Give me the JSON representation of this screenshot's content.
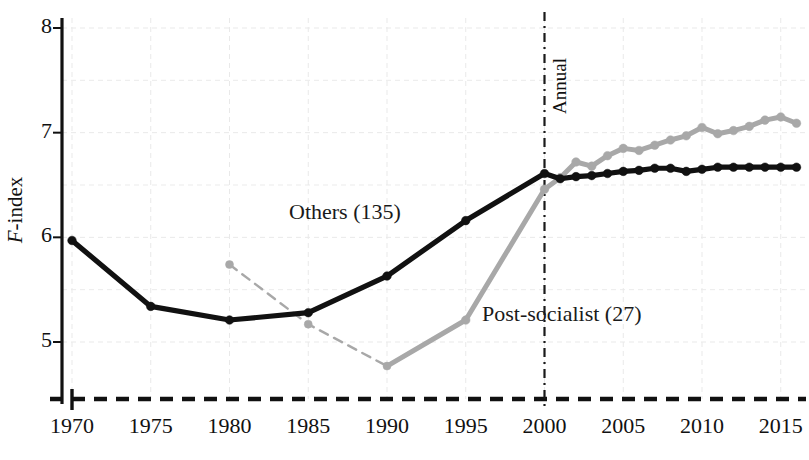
{
  "chart_data": {
    "type": "line",
    "title": "",
    "xlabel": "",
    "ylabel": "F-index",
    "ylabel_parts": {
      "italic": "F",
      "rest": "-index"
    },
    "xlim": [
      1970,
      2016
    ],
    "ylim": [
      4.65,
      8.0
    ],
    "yticks": [
      5,
      6,
      7,
      8
    ],
    "ytick_labels": [
      "5",
      "6",
      "7",
      "8"
    ],
    "xticks": [
      1970,
      1975,
      1980,
      1985,
      1990,
      1995,
      2000,
      2005,
      2010,
      2015
    ],
    "xtick_labels": [
      "1970",
      "1975",
      "1980",
      "1985",
      "1990",
      "1995",
      "2000",
      "2005",
      "2010",
      "2015"
    ],
    "grid": true,
    "grid_color": "#e9e9e9",
    "legend": "inline-labels",
    "annotations": [
      {
        "name": "annual-divider-label",
        "text": "Annual",
        "x": 2000,
        "rotation": 90
      }
    ],
    "divider": {
      "name": "annual-divider",
      "x": 2000,
      "style": "dash-dot",
      "color": "#1a1a1a"
    },
    "baseline": {
      "style": "dashed",
      "y": 4.65,
      "color": "#111111"
    },
    "series": [
      {
        "name": "Others (135)",
        "label": "Others (135)",
        "color": "#111111",
        "marker": "circle",
        "x": [
          1970,
          1975,
          1980,
          1985,
          1990,
          1995,
          2000,
          2001,
          2002,
          2003,
          2004,
          2005,
          2006,
          2007,
          2008,
          2009,
          2010,
          2011,
          2012,
          2013,
          2014,
          2015,
          2016
        ],
        "values": [
          5.97,
          5.34,
          5.21,
          5.28,
          5.63,
          6.16,
          6.61,
          6.56,
          6.58,
          6.59,
          6.61,
          6.63,
          6.64,
          6.66,
          6.66,
          6.63,
          6.65,
          6.67,
          6.67,
          6.67,
          6.67,
          6.67,
          6.67
        ]
      },
      {
        "name": "Post-socialist (27)",
        "label": "Post-socialist (27)",
        "color": "#a8a8a8",
        "marker": "circle",
        "dashed_segment_years": [
          1980,
          1985,
          1990
        ],
        "x": [
          1980,
          1985,
          1990,
          1995,
          2000,
          2001,
          2002,
          2003,
          2004,
          2005,
          2006,
          2007,
          2008,
          2009,
          2010,
          2011,
          2012,
          2013,
          2014,
          2015,
          2016
        ],
        "values": [
          5.74,
          5.17,
          4.77,
          5.21,
          6.46,
          6.57,
          6.72,
          6.68,
          6.78,
          6.85,
          6.83,
          6.88,
          6.93,
          6.97,
          7.05,
          6.99,
          7.02,
          7.06,
          7.12,
          7.15,
          7.09
        ]
      }
    ]
  },
  "labels": {
    "others": "Others (135)",
    "post_socialist": "Post-socialist (27)",
    "annual": "Annual",
    "y_axis_italic": "F",
    "y_axis_rest": "-index"
  }
}
